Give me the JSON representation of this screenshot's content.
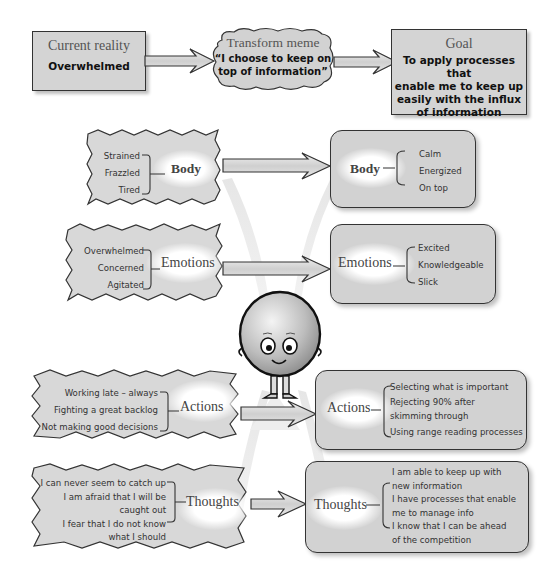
{
  "top_row": {
    "current_reality": {
      "title": "Current reality",
      "value": "Overwhelmed"
    },
    "transform_meme": {
      "title": "Transform meme",
      "value_line1": "“I choose to keep on",
      "value_line2": "top of information”"
    },
    "goal": {
      "title": "Goal",
      "lines": [
        "To apply processes that",
        "enable me to keep up",
        "easily with the influx",
        "of information"
      ]
    }
  },
  "rows": [
    {
      "category": "Body",
      "current": [
        "Strained",
        "Frazzled",
        "Tired"
      ],
      "desired": [
        "Calm",
        "Energized",
        "On top"
      ]
    },
    {
      "category": "Emotions",
      "current": [
        "Overwhelmed",
        "Concerned",
        "Agitated"
      ],
      "desired": [
        "Excited",
        "Knowledgeable",
        "Slick"
      ]
    },
    {
      "category": "Actions",
      "current": [
        "Working late – always",
        "Fighting a great backlog",
        "Not making good decisions"
      ],
      "desired": [
        "Selecting what is important",
        "Rejecting 90% after",
        "skimming through",
        "Using range reading processes"
      ]
    },
    {
      "category": "Thoughts",
      "current": [
        "I can never seem to catch up",
        "I am afraid that I will be",
        "caught out",
        "I fear that I do not know",
        "what I should"
      ],
      "desired": [
        "I am able to keep up with",
        "new information",
        "I have processes that enable",
        "me to manage info",
        "I know that I can be ahead",
        "of the competition"
      ]
    }
  ],
  "character": {
    "icon": "smiling-balloon-head-character"
  },
  "colors": {
    "box_fill": "#d4d4d4",
    "border": "#333333",
    "title_text": "#555555",
    "body_text": "#111111"
  }
}
